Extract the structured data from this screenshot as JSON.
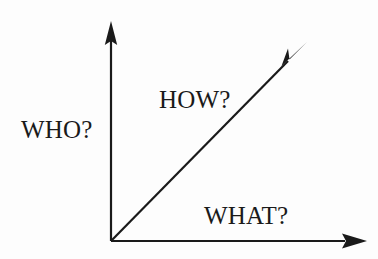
{
  "diagram": {
    "background_color": "#fdfdfd",
    "stroke_color": "#1a1a1a",
    "labels": {
      "vertical": "WHO?",
      "diagonal": "HOW?",
      "horizontal": "WHAT?"
    },
    "axes": [
      {
        "name": "vertical-axis",
        "label": "WHO?",
        "direction": "up",
        "origin": [
          111,
          241
        ],
        "tip": [
          111,
          22
        ]
      },
      {
        "name": "diagonal-axis",
        "label": "HOW?",
        "direction": "up-right",
        "origin": [
          111,
          241
        ],
        "tip": [
          306,
          43
        ]
      },
      {
        "name": "horizontal-axis",
        "label": "WHAT?",
        "direction": "right",
        "origin": [
          111,
          241
        ],
        "tip": [
          366,
          241
        ]
      }
    ]
  }
}
